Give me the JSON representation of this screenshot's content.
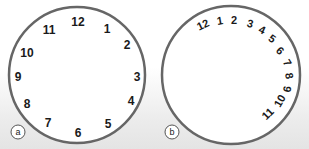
{
  "figure": {
    "background_top": "#ffffff",
    "background_bottom": "#e4e4e4",
    "circle_stroke": "#666666",
    "panels": [
      {
        "label": "a",
        "center": [
          77,
          75
        ],
        "radius": 68,
        "numbers": [
          {
            "text": "12",
            "x": 78,
            "y": 22,
            "rot": 0
          },
          {
            "text": "1",
            "x": 107,
            "y": 29,
            "rot": 0
          },
          {
            "text": "2",
            "x": 127,
            "y": 45,
            "rot": 0
          },
          {
            "text": "3",
            "x": 137,
            "y": 77,
            "rot": 0
          },
          {
            "text": "4",
            "x": 131,
            "y": 101,
            "rot": 0
          },
          {
            "text": "5",
            "x": 108,
            "y": 124,
            "rot": 0
          },
          {
            "text": "6",
            "x": 78,
            "y": 133,
            "rot": 0
          },
          {
            "text": "7",
            "x": 48,
            "y": 123,
            "rot": 0
          },
          {
            "text": "8",
            "x": 27,
            "y": 104,
            "rot": 0
          },
          {
            "text": "9",
            "x": 18,
            "y": 77,
            "rot": 0
          },
          {
            "text": "10",
            "x": 27,
            "y": 53,
            "rot": 0
          },
          {
            "text": "11",
            "x": 49,
            "y": 30,
            "rot": 0
          }
        ]
      },
      {
        "label": "b",
        "center": [
          77,
          75
        ],
        "radius": 69,
        "numbers": [
          {
            "text": "12",
            "x": 49,
            "y": 25,
            "rot": -25
          },
          {
            "text": "1",
            "x": 66,
            "y": 21,
            "rot": -10
          },
          {
            "text": "2",
            "x": 80,
            "y": 20,
            "rot": 0
          },
          {
            "text": "3",
            "x": 96,
            "y": 24,
            "rot": 15
          },
          {
            "text": "4",
            "x": 108,
            "y": 30,
            "rot": 25
          },
          {
            "text": "5",
            "x": 118,
            "y": 39,
            "rot": 35
          },
          {
            "text": "6",
            "x": 126,
            "y": 51,
            "rot": 45
          },
          {
            "text": "7",
            "x": 133,
            "y": 63,
            "rot": 60
          },
          {
            "text": "8",
            "x": 135,
            "y": 76,
            "rot": 80
          },
          {
            "text": "9",
            "x": 133,
            "y": 89,
            "rot": 100
          },
          {
            "text": "10",
            "x": 126,
            "y": 101,
            "rot": -60
          },
          {
            "text": "11",
            "x": 114,
            "y": 114,
            "rot": -45
          }
        ]
      }
    ]
  }
}
